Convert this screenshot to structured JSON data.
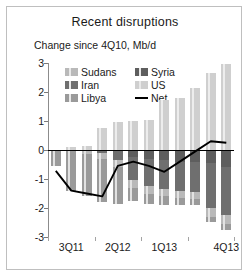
{
  "chart": {
    "title": "Recent disruptions",
    "subtitle": "Change since 4Q10, Mb/d"
  },
  "legend": {
    "items": [
      {
        "label": "Sudans",
        "color": "#b9b9b9",
        "type": "bar"
      },
      {
        "label": "Syria",
        "color": "#5e5e5e",
        "type": "bar"
      },
      {
        "label": "Iran",
        "color": "#6f6f6f",
        "type": "bar"
      },
      {
        "label": "US",
        "color": "#cfcfcf",
        "type": "bar"
      },
      {
        "label": "Libya",
        "color": "#9a9a9a",
        "type": "bar"
      },
      {
        "label": "Net",
        "color": "#000000",
        "type": "line"
      }
    ]
  },
  "chart_data": {
    "type": "bar",
    "subtype": "stacked-bar-with-line",
    "title": "Recent disruptions",
    "subtitle": "Change since 4Q10, Mb/d",
    "xlabel": "",
    "ylabel": "Mb/d",
    "ylim": [
      -3,
      3
    ],
    "yticks": [
      3,
      2,
      1,
      0,
      -1,
      -2,
      -3
    ],
    "ytick_labels": [
      "3",
      "2",
      "1",
      "0",
      "-1",
      "-2",
      "-3"
    ],
    "grid": false,
    "legend_position": "top-inside",
    "categories": [
      "2Q11",
      "3Q11",
      "4Q11",
      "1Q12",
      "2Q12",
      "3Q12",
      "4Q12",
      "1Q13",
      "2Q13",
      "3Q13",
      "4Q13e",
      "4Q13"
    ],
    "xtick_labels": [
      "3Q11",
      "2Q12",
      "1Q13",
      "4Q13"
    ],
    "xtick_categories": [
      "3Q11",
      "2Q12",
      "1Q13",
      "4Q13"
    ],
    "series": [
      {
        "name": "US",
        "color": "#cfcfcf",
        "values": [
          0.0,
          0.12,
          0.15,
          0.75,
          0.95,
          1.0,
          1.05,
          1.72,
          1.78,
          2.13,
          2.65,
          2.95
        ]
      },
      {
        "name": "Libya",
        "color": "#9a9a9a",
        "values": [
          -0.55,
          -1.35,
          -1.45,
          -1.5,
          -1.25,
          -0.45,
          -0.35,
          -0.3,
          -0.25,
          -0.2,
          -0.2,
          -0.2
        ]
      },
      {
        "name": "Sudans",
        "color": "#b9b9b9",
        "values": [
          0.0,
          -0.05,
          -0.15,
          -0.2,
          -0.25,
          -0.25,
          -0.25,
          -0.25,
          -0.25,
          -0.25,
          -0.3,
          -0.3
        ]
      },
      {
        "name": "Iran",
        "color": "#6f6f6f",
        "values": [
          0.0,
          0.0,
          0.0,
          -0.1,
          -0.3,
          -0.8,
          -0.95,
          -1.0,
          -1.0,
          -1.05,
          -1.55,
          -1.65
        ]
      },
      {
        "name": "Syria",
        "color": "#5e5e5e",
        "values": [
          0.0,
          0.0,
          0.0,
          0.0,
          -0.05,
          -0.25,
          -0.3,
          -0.35,
          -0.4,
          -0.4,
          -0.45,
          -0.6
        ]
      },
      {
        "name": "Net",
        "color": "#000000",
        "type": "line",
        "values": [
          -0.72,
          -1.4,
          -1.5,
          -1.6,
          -0.55,
          -0.4,
          -0.55,
          -0.75,
          -0.4,
          -0.05,
          0.3,
          0.25
        ]
      }
    ]
  }
}
